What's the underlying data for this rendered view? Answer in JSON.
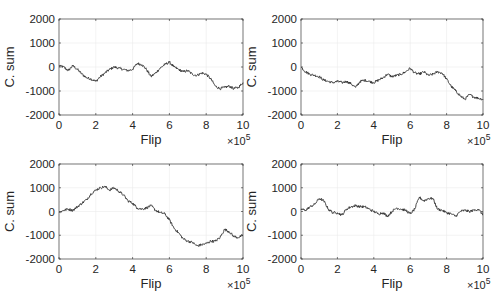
{
  "figure": {
    "layout": "2x2 grid",
    "background": "#ffffff",
    "line_color": "#333333",
    "axes_color": "#262626",
    "grid_color": "#ebebeb"
  },
  "chart_data": [
    {
      "type": "line",
      "position": "top-left",
      "title": "",
      "xlabel": "Flip",
      "ylabel": "C. sum",
      "x_multiplier": "×10^5",
      "xlim": [
        0,
        10
      ],
      "ylim": [
        -2000,
        2000
      ],
      "xticks": [
        "0",
        "2",
        "4",
        "6",
        "8",
        "10"
      ],
      "yticks": [
        "2000",
        "1000",
        "0",
        "-1000",
        "-2000"
      ],
      "grid": true,
      "legend": null,
      "x": [
        0,
        0.25,
        0.5,
        0.75,
        1.0,
        1.25,
        1.5,
        1.75,
        2.0,
        2.25,
        2.5,
        2.75,
        3.0,
        3.25,
        3.5,
        3.75,
        4.0,
        4.25,
        4.5,
        4.75,
        5.0,
        5.25,
        5.5,
        5.75,
        6.0,
        6.25,
        6.5,
        6.75,
        7.0,
        7.25,
        7.5,
        7.75,
        8.0,
        8.25,
        8.5,
        8.75,
        9.0,
        9.25,
        9.5,
        9.75,
        10.0
      ],
      "values": [
        50,
        0,
        -150,
        50,
        -100,
        -300,
        -450,
        -500,
        -600,
        -400,
        -250,
        -100,
        0,
        -50,
        -100,
        -150,
        -100,
        150,
        100,
        -100,
        -400,
        -250,
        -50,
        100,
        200,
        0,
        -100,
        -200,
        -150,
        -300,
        -350,
        -250,
        -300,
        -500,
        -800,
        -900,
        -850,
        -800,
        -900,
        -850,
        -650
      ]
    },
    {
      "type": "line",
      "position": "top-right",
      "title": "",
      "xlabel": "Flip",
      "ylabel": "C. sum",
      "x_multiplier": "×10^5",
      "xlim": [
        0,
        10
      ],
      "ylim": [
        -2000,
        2000
      ],
      "xticks": [
        "0",
        "2",
        "4",
        "6",
        "8",
        "10"
      ],
      "yticks": [
        "2000",
        "1000",
        "0",
        "-1000",
        "-2000"
      ],
      "grid": true,
      "legend": null,
      "x": [
        0,
        0.25,
        0.5,
        0.75,
        1.0,
        1.25,
        1.5,
        1.75,
        2.0,
        2.25,
        2.5,
        2.75,
        3.0,
        3.25,
        3.5,
        3.75,
        4.0,
        4.25,
        4.5,
        4.75,
        5.0,
        5.25,
        5.5,
        5.75,
        6.0,
        6.25,
        6.5,
        6.75,
        7.0,
        7.25,
        7.5,
        7.75,
        8.0,
        8.25,
        8.5,
        8.75,
        9.0,
        9.25,
        9.5,
        9.75,
        10.0
      ],
      "values": [
        0,
        -200,
        -300,
        -350,
        -400,
        -550,
        -600,
        -650,
        -600,
        -650,
        -600,
        -700,
        -850,
        -600,
        -550,
        -600,
        -650,
        -550,
        -450,
        -300,
        -400,
        -350,
        -300,
        -200,
        -50,
        -250,
        -300,
        -200,
        -350,
        -300,
        -200,
        -250,
        -500,
        -800,
        -1000,
        -1200,
        -1350,
        -1150,
        -1250,
        -1300,
        -1350
      ]
    },
    {
      "type": "line",
      "position": "bottom-left",
      "title": "",
      "xlabel": "Flip",
      "ylabel": "C. sum",
      "x_multiplier": "×10^5",
      "xlim": [
        0,
        10
      ],
      "ylim": [
        -2000,
        2000
      ],
      "xticks": [
        "0",
        "2",
        "4",
        "6",
        "8",
        "10"
      ],
      "yticks": [
        "2000",
        "1000",
        "0",
        "-1000",
        "-2000"
      ],
      "grid": true,
      "legend": null,
      "x": [
        0,
        0.25,
        0.5,
        0.75,
        1.0,
        1.25,
        1.5,
        1.75,
        2.0,
        2.25,
        2.5,
        2.75,
        3.0,
        3.25,
        3.5,
        3.75,
        4.0,
        4.25,
        4.5,
        4.75,
        5.0,
        5.25,
        5.5,
        5.75,
        6.0,
        6.25,
        6.5,
        6.75,
        7.0,
        7.25,
        7.5,
        7.75,
        8.0,
        8.25,
        8.5,
        8.75,
        9.0,
        9.25,
        9.5,
        9.75,
        10.0
      ],
      "values": [
        -50,
        50,
        100,
        50,
        200,
        350,
        500,
        750,
        900,
        1000,
        1050,
        900,
        1000,
        850,
        700,
        450,
        350,
        150,
        100,
        150,
        250,
        50,
        -50,
        -100,
        -350,
        -700,
        -900,
        -1150,
        -1250,
        -1300,
        -1450,
        -1400,
        -1350,
        -1250,
        -1250,
        -1100,
        -750,
        -850,
        -1050,
        -1100,
        -1000
      ]
    },
    {
      "type": "line",
      "position": "bottom-right",
      "title": "",
      "xlabel": "Flip",
      "ylabel": "C. sum",
      "x_multiplier": "×10^5",
      "xlim": [
        0,
        10
      ],
      "ylim": [
        -2000,
        2000
      ],
      "xticks": [
        "0",
        "2",
        "4",
        "6",
        "8",
        "10"
      ],
      "yticks": [
        "2000",
        "1000",
        "0",
        "-1000",
        "-2000"
      ],
      "grid": true,
      "legend": null,
      "x": [
        0,
        0.25,
        0.5,
        0.75,
        1.0,
        1.25,
        1.5,
        1.75,
        2.0,
        2.25,
        2.5,
        2.75,
        3.0,
        3.25,
        3.5,
        3.75,
        4.0,
        4.25,
        4.5,
        4.75,
        5.0,
        5.25,
        5.5,
        5.75,
        6.0,
        6.25,
        6.5,
        6.75,
        7.0,
        7.25,
        7.5,
        7.75,
        8.0,
        8.25,
        8.5,
        8.75,
        9.0,
        9.25,
        9.5,
        9.75,
        10.0
      ],
      "values": [
        100,
        50,
        200,
        300,
        550,
        450,
        100,
        -50,
        -50,
        -150,
        100,
        200,
        250,
        200,
        200,
        100,
        0,
        -100,
        -50,
        -200,
        0,
        150,
        100,
        50,
        -100,
        100,
        600,
        450,
        550,
        550,
        100,
        50,
        -50,
        -100,
        -200,
        0,
        50,
        0,
        50,
        100,
        -150
      ]
    }
  ]
}
